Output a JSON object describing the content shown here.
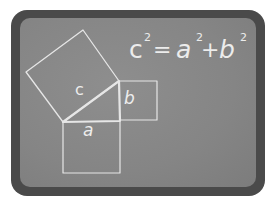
{
  "board": {
    "frame_color": "#4a4a4a",
    "surface_color": "#888888",
    "chalk_color": "#e6e6e6"
  },
  "equation": {
    "c": "c",
    "c_exp": "2",
    "eq": "=",
    "a": "a",
    "a_exp": "2",
    "plus": "+",
    "b": "b",
    "b_exp": "2"
  },
  "labels": {
    "hypotenuse": "c",
    "vertical_leg": "b",
    "horizontal_leg": "a"
  }
}
